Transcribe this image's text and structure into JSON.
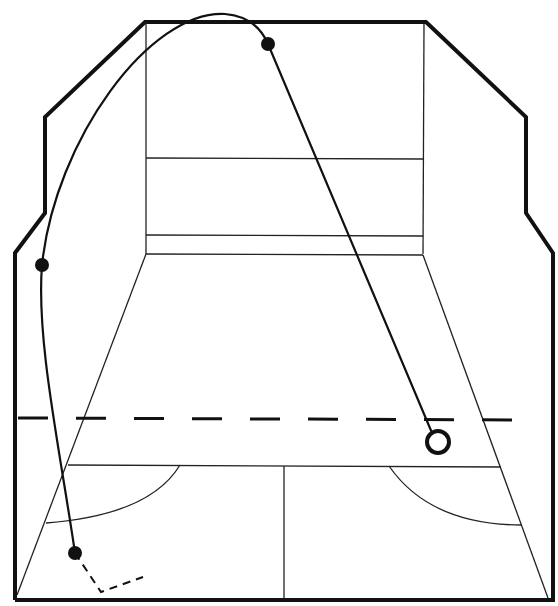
{
  "diagram": {
    "title": "Squash court shot trajectory",
    "colors": {
      "line": "#111111",
      "background": "#ffffff"
    },
    "court": {
      "outer_outline": "thick wall outline",
      "front_wall_lines": [
        "service line",
        "tin line"
      ],
      "floor_lines": [
        "short line",
        "half-court line",
        "service boxes"
      ],
      "dashed_line": "reference line across court"
    },
    "ball_path": {
      "markers": [
        {
          "label": "start point",
          "type": "filled-dot"
        },
        {
          "label": "side wall contact",
          "type": "filled-dot"
        },
        {
          "label": "front wall contact",
          "type": "filled-dot"
        },
        {
          "label": "landing point",
          "type": "open-ring"
        }
      ]
    }
  }
}
